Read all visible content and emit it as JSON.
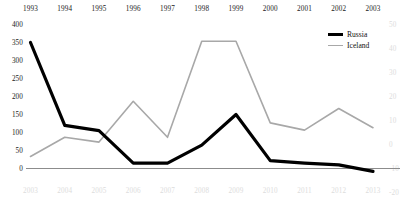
{
  "chart_data": {
    "type": "line",
    "title": "",
    "xlabel": "",
    "ylabel": "",
    "grid": false,
    "legend_position": "top-right",
    "x_top": {
      "label": "",
      "ticks": [
        "1993",
        "1994",
        "1995",
        "1996",
        "1997",
        "1998",
        "1999",
        "2000",
        "2001",
        "2002",
        "2003"
      ]
    },
    "x_bottom": {
      "label": "",
      "faded": true,
      "ticks": [
        "2003",
        "2004",
        "2005",
        "2006",
        "2007",
        "2008",
        "2009",
        "2010",
        "2011",
        "2012",
        "2013"
      ]
    },
    "y_left": {
      "label": "",
      "ticks": [
        "0",
        "50",
        "100",
        "150",
        "200",
        "250",
        "300",
        "350",
        "400"
      ],
      "ylim": [
        0,
        400
      ]
    },
    "y_right": {
      "label": "",
      "faded": true,
      "ticks": [
        "-20",
        "-10",
        "0",
        "10",
        "20",
        "30",
        "40",
        "50"
      ],
      "ylim": [
        -20,
        50
      ]
    },
    "series": [
      {
        "name": "Russia",
        "color": "#000000",
        "axis": "left",
        "x": [
          "1993",
          "1994",
          "1995",
          "1996",
          "1997",
          "1998",
          "1999",
          "2000",
          "2001",
          "2002",
          "2003"
        ],
        "values": [
          350,
          120,
          105,
          15,
          15,
          65,
          150,
          22,
          15,
          10,
          -8
        ]
      },
      {
        "name": "Iceland",
        "color": "#a8a8a8",
        "axis": "right",
        "x": [
          "2003",
          "2004",
          "2005",
          "2006",
          "2007",
          "2008",
          "2009",
          "2010",
          "2011",
          "2012",
          "2013"
        ],
        "values": [
          -5,
          3,
          1,
          18,
          3,
          43,
          43,
          9,
          6,
          15,
          7
        ]
      }
    ]
  },
  "legend": {
    "items": [
      {
        "label": "Russia"
      },
      {
        "label": "Iceland"
      }
    ]
  },
  "colors": {
    "russia": "#000000",
    "iceland": "#a8a8a8",
    "axis_text": "#1a1a1a",
    "faded_text": "#dcdcdc",
    "zero_line": "#8c8c8c",
    "background": "#ffffff"
  }
}
